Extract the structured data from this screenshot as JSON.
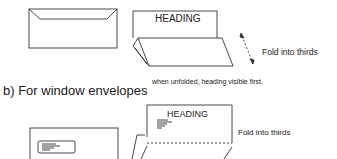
{
  "section_a": {
    "heading_label": "HEADING",
    "fold_label": "Fold into thirds",
    "note": "when unfolded, heading visible first."
  },
  "section_b": {
    "title": "b) For window envelopes",
    "heading_label": "HEADING",
    "fold_label": "Fold into thirds"
  },
  "colors": {
    "line": "#333333",
    "background": "#ffffff"
  }
}
